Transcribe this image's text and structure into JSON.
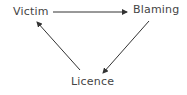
{
  "diagram": {
    "type": "cycle",
    "nodes": [
      {
        "id": "victim",
        "label": "Victim"
      },
      {
        "id": "blaming",
        "label": "Blaming"
      },
      {
        "id": "licence",
        "label": "Licence"
      }
    ],
    "edges": [
      {
        "from": "victim",
        "to": "blaming"
      },
      {
        "from": "blaming",
        "to": "licence"
      },
      {
        "from": "licence",
        "to": "victim"
      }
    ],
    "colors": {
      "text": "#444444",
      "arrow": "#333333"
    }
  }
}
